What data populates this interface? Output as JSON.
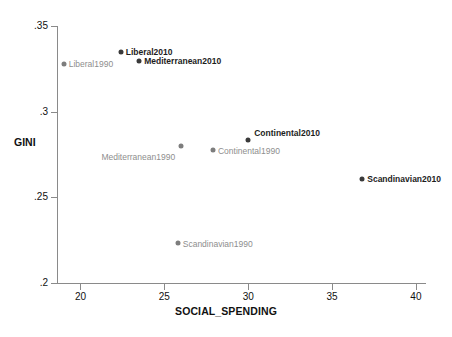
{
  "chart_data": {
    "type": "scatter",
    "title": "",
    "xlabel": "SOCIAL_SPENDING",
    "ylabel": "GINI",
    "xlim": [
      18.6,
      40.6
    ],
    "ylim": [
      0.2,
      0.35
    ],
    "grid": false,
    "legend": "none",
    "xticks": [
      "20",
      "25",
      "30",
      "35",
      "40"
    ],
    "xtick_values": [
      20,
      25,
      30,
      35,
      40
    ],
    "yticks": [
      ".35",
      ".3",
      ".25",
      ".2"
    ],
    "ytick_values": [
      0.35,
      0.3,
      0.25,
      0.2
    ],
    "series": [
      {
        "name": "2010",
        "color": "#3a3a3a",
        "points": [
          {
            "label": "Liberal2010",
            "x": 22.4,
            "y": 0.3348
          },
          {
            "label": "Mediterranean2010",
            "x": 23.5,
            "y": 0.3294
          },
          {
            "label": "Continental2010",
            "x": 30.0,
            "y": 0.2834
          },
          {
            "label": "Scandinavian2010",
            "x": 36.8,
            "y": 0.2606
          }
        ]
      },
      {
        "name": "1990",
        "color": "#7d7d7d",
        "points": [
          {
            "label": "Liberal1990",
            "x": 19.0,
            "y": 0.3278
          },
          {
            "label": "Mediterranean1990",
            "x": 26.0,
            "y": 0.2798
          },
          {
            "label": "Continental1990",
            "x": 27.9,
            "y": 0.2774
          },
          {
            "label": "Scandinavian1990",
            "x": 25.8,
            "y": 0.2234
          }
        ]
      }
    ]
  },
  "axes": {
    "x_title": "SOCIAL_SPENDING",
    "y_title": "GINI"
  }
}
